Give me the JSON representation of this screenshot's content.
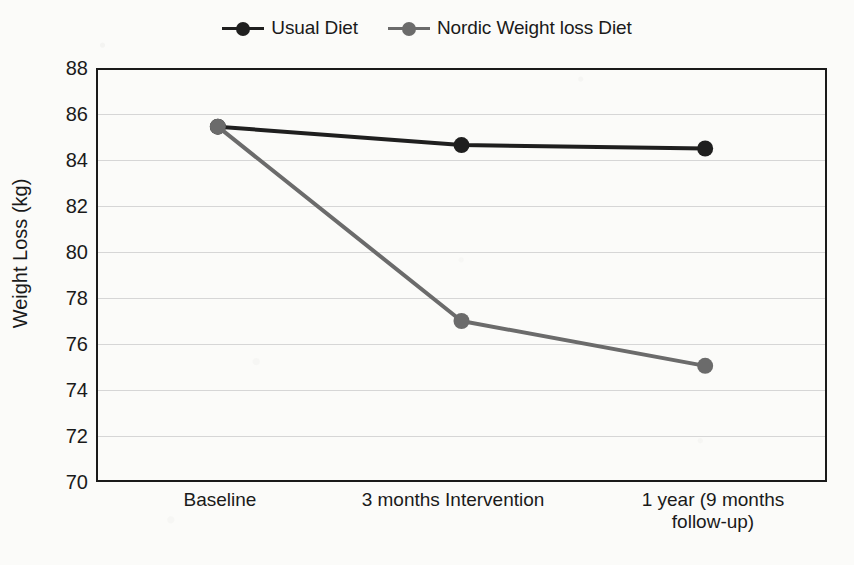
{
  "chart_data": {
    "type": "line",
    "title": "",
    "xlabel": "",
    "ylabel": "Weight Loss (kg)",
    "categories": [
      "Baseline",
      "3 months Intervention",
      "1 year (9 months\nfollow-up)"
    ],
    "category_labels": [
      {
        "line1": "Baseline",
        "line2": ""
      },
      {
        "line1": "3 months Intervention",
        "line2": ""
      },
      {
        "line1": "1 year (9 months",
        "line2": "follow-up)"
      }
    ],
    "series": [
      {
        "name": "Usual Diet",
        "color": "#1f1f1f",
        "marker": "circle",
        "values": [
          85.45,
          84.65,
          84.5
        ]
      },
      {
        "name": "Nordic Weight loss Diet",
        "color": "#6b6b6b",
        "marker": "circle",
        "values": [
          85.45,
          77.0,
          75.05
        ]
      }
    ],
    "ylim": [
      70,
      88
    ],
    "ytick_step": 2,
    "yticks": [
      88,
      86,
      84,
      82,
      80,
      78,
      76,
      74,
      72,
      70
    ],
    "ytick_labels": [
      "88",
      "86",
      "84",
      "82",
      "80",
      "78",
      "76",
      "74",
      "72",
      "70"
    ],
    "grid": true,
    "grid_axis": "y",
    "grid_color": "#d6d6d6",
    "legend_position": "top-center",
    "plot_background": "#fbfbf9",
    "frame_color": "#1a1a1a"
  },
  "legend": {
    "entries": [
      {
        "label": "Usual Diet",
        "color": "#1f1f1f"
      },
      {
        "label": "Nordic Weight loss Diet",
        "color": "#6b6b6b"
      }
    ]
  }
}
